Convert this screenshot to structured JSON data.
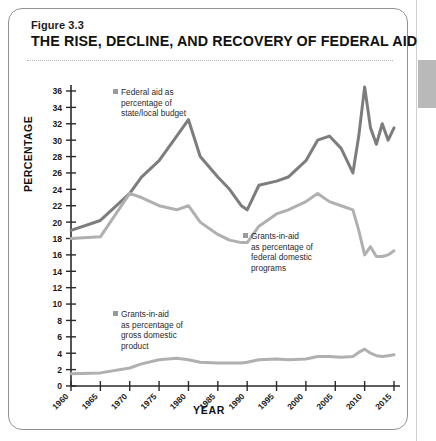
{
  "figure": {
    "label": "Figure 3.3",
    "title": "THE RISE, DECLINE, AND RECOVERY OF FEDERAL AID"
  },
  "axes": {
    "ylabel": "PERCENTAGE",
    "xlabel": "YEAR"
  },
  "legend": [
    {
      "id": "federal-aid-state-local",
      "line1": "Federal aid as",
      "line2": "percentage of",
      "line3": "state/local budget",
      "line4": "",
      "color": "#7d7d7d"
    },
    {
      "id": "grants-federal-domestic",
      "line1": "Grants-in-aid",
      "line2": "as percentage of",
      "line3": "federal domestic",
      "line4": "programs",
      "color": "#b0b0b0"
    },
    {
      "id": "grants-gdp",
      "line1": "Grants-in-aid",
      "line2": "as percentage of",
      "line3": "gross domestic",
      "line4": "product",
      "color": "#b0b0b0"
    }
  ],
  "chart_data": {
    "type": "line",
    "title": "THE RISE, DECLINE, AND RECOVERY OF FEDERAL AID",
    "xlabel": "YEAR",
    "ylabel": "PERCENTAGE",
    "grid": false,
    "legend_position": "inline-annotations",
    "xlim": [
      1960,
      2015
    ],
    "ylim": [
      0,
      36
    ],
    "yticks": [
      0,
      2,
      4,
      6,
      8,
      10,
      12,
      14,
      16,
      18,
      20,
      22,
      24,
      26,
      28,
      30,
      32,
      34,
      36
    ],
    "xticks": [
      1960,
      1965,
      1970,
      1975,
      1980,
      1985,
      1990,
      1995,
      2000,
      2005,
      2010,
      2015
    ],
    "x": [
      1960,
      1965,
      1970,
      1972,
      1975,
      1978,
      1980,
      1982,
      1985,
      1987,
      1989,
      1990,
      1992,
      1995,
      1997,
      2000,
      2002,
      2004,
      2006,
      2008,
      2009,
      2010,
      2011,
      2012,
      2013,
      2014,
      2015
    ],
    "series": [
      {
        "name": "Federal aid as percentage of state/local budget",
        "color": "#7d7d7d",
        "values": [
          19.0,
          20.2,
          23.5,
          25.5,
          27.5,
          30.5,
          32.5,
          28.0,
          25.5,
          24.0,
          22.0,
          21.5,
          24.5,
          25.0,
          25.5,
          27.5,
          30.0,
          30.5,
          29.0,
          26.0,
          30.5,
          36.5,
          31.5,
          29.5,
          32.0,
          30.0,
          31.5
        ]
      },
      {
        "name": "Grants-in-aid as percentage of federal domestic programs",
        "color": "#b0b0b0",
        "values": [
          18.0,
          18.2,
          23.5,
          23.0,
          22.0,
          21.5,
          22.0,
          20.0,
          18.5,
          17.8,
          17.5,
          17.5,
          19.5,
          21.0,
          21.5,
          22.5,
          23.5,
          22.5,
          22.0,
          21.5,
          19.0,
          16.0,
          17.0,
          15.8,
          15.8,
          16.0,
          16.5
        ]
      },
      {
        "name": "Grants-in-aid as percentage of gross domestic product",
        "color": "#b0b0b0",
        "values": [
          1.5,
          1.6,
          2.2,
          2.7,
          3.2,
          3.4,
          3.2,
          2.9,
          2.8,
          2.8,
          2.8,
          2.9,
          3.2,
          3.3,
          3.2,
          3.3,
          3.6,
          3.6,
          3.5,
          3.6,
          4.1,
          4.5,
          4.0,
          3.7,
          3.6,
          3.7,
          3.8
        ]
      }
    ]
  }
}
